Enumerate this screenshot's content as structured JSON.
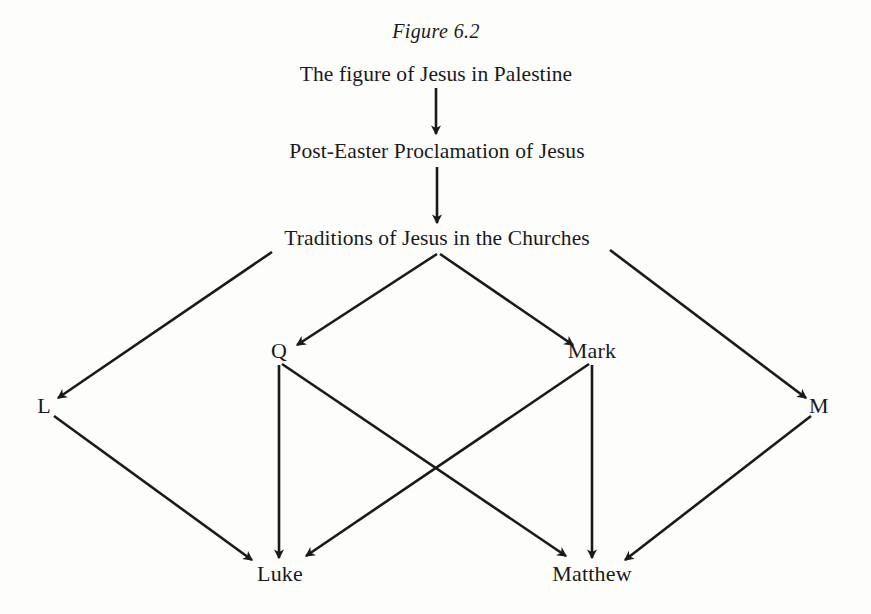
{
  "figure": {
    "title": "Figure 6.2",
    "background_color": "#fdfdfc",
    "ink_color": "#1a1a1a"
  },
  "nodes": [
    {
      "id": "palestine",
      "label": "The figure of Jesus in Palestine",
      "x": 436,
      "y": 75,
      "kind": "stage"
    },
    {
      "id": "proclaim",
      "label": "Post-Easter Proclamation of Jesus",
      "x": 437,
      "y": 152,
      "kind": "stage"
    },
    {
      "id": "traditions",
      "label": "Traditions of Jesus in the Churches",
      "x": 437,
      "y": 239,
      "kind": "stage"
    },
    {
      "id": "q",
      "label": "Q",
      "x": 279,
      "y": 351,
      "kind": "source"
    },
    {
      "id": "mark",
      "label": "Mark",
      "x": 592,
      "y": 351,
      "kind": "source"
    },
    {
      "id": "l",
      "label": "L",
      "x": 44,
      "y": 406,
      "kind": "source"
    },
    {
      "id": "m",
      "label": "M",
      "x": 819,
      "y": 406,
      "kind": "source"
    },
    {
      "id": "luke",
      "label": "Luke",
      "x": 280,
      "y": 574,
      "kind": "gospel"
    },
    {
      "id": "matthew",
      "label": "Matthew",
      "x": 592,
      "y": 574,
      "kind": "gospel"
    }
  ],
  "edges": [
    {
      "id": "palestine-to-proclaim",
      "from": "palestine",
      "to": "proclaim",
      "x1": 436,
      "y1": 88,
      "x2": 436,
      "y2": 134
    },
    {
      "id": "proclaim-to-traditions",
      "from": "proclaim",
      "to": "traditions",
      "x1": 437,
      "y1": 167,
      "x2": 437,
      "y2": 223
    },
    {
      "id": "traditions-to-q",
      "from": "traditions",
      "to": "q",
      "x1": 437,
      "y1": 254,
      "x2": 297,
      "y2": 345
    },
    {
      "id": "traditions-to-mark",
      "from": "traditions",
      "to": "mark",
      "x1": 440,
      "y1": 254,
      "x2": 573,
      "y2": 345
    },
    {
      "id": "traditions-to-l",
      "from": "traditions",
      "to": "l",
      "x1": 272,
      "y1": 252,
      "x2": 58,
      "y2": 398
    },
    {
      "id": "traditions-to-m",
      "from": "traditions",
      "to": "m",
      "x1": 610,
      "y1": 250,
      "x2": 806,
      "y2": 398
    },
    {
      "id": "q-to-luke",
      "from": "q",
      "to": "luke",
      "x1": 279,
      "y1": 365,
      "x2": 279,
      "y2": 558
    },
    {
      "id": "q-to-matthew",
      "from": "q",
      "to": "matthew",
      "x1": 282,
      "y1": 364,
      "x2": 566,
      "y2": 556
    },
    {
      "id": "mark-to-luke",
      "from": "mark",
      "to": "luke",
      "x1": 589,
      "y1": 364,
      "x2": 306,
      "y2": 556
    },
    {
      "id": "mark-to-matthew",
      "from": "mark",
      "to": "matthew",
      "x1": 592,
      "y1": 365,
      "x2": 592,
      "y2": 558
    },
    {
      "id": "l-to-luke",
      "from": "l",
      "to": "luke",
      "x1": 54,
      "y1": 416,
      "x2": 252,
      "y2": 560
    },
    {
      "id": "m-to-matthew",
      "from": "m",
      "to": "matthew",
      "x1": 811,
      "y1": 416,
      "x2": 625,
      "y2": 560
    }
  ],
  "chart_data": {
    "type": "diagram",
    "title": "Figure 6.2",
    "subtype": "synoptic-problem-two-source-flowchart",
    "direction": "top-to-bottom",
    "levels": [
      {
        "level": 1,
        "nodes": [
          "The figure of Jesus in Palestine"
        ]
      },
      {
        "level": 2,
        "nodes": [
          "Post-Easter Proclamation of Jesus"
        ]
      },
      {
        "level": 3,
        "nodes": [
          "Traditions of Jesus in the Churches"
        ]
      },
      {
        "level": 4,
        "nodes": [
          "Q",
          "Mark"
        ]
      },
      {
        "level": 4,
        "nodes": [
          "L",
          "M"
        ]
      },
      {
        "level": 5,
        "nodes": [
          "Luke",
          "Matthew"
        ]
      }
    ],
    "relations": [
      [
        "The figure of Jesus in Palestine",
        "Post-Easter Proclamation of Jesus"
      ],
      [
        "Post-Easter Proclamation of Jesus",
        "Traditions of Jesus in the Churches"
      ],
      [
        "Traditions of Jesus in the Churches",
        "Q"
      ],
      [
        "Traditions of Jesus in the Churches",
        "Mark"
      ],
      [
        "Traditions of Jesus in the Churches",
        "L"
      ],
      [
        "Traditions of Jesus in the Churches",
        "M"
      ],
      [
        "Q",
        "Luke"
      ],
      [
        "Q",
        "Matthew"
      ],
      [
        "Mark",
        "Luke"
      ],
      [
        "Mark",
        "Matthew"
      ],
      [
        "L",
        "Luke"
      ],
      [
        "M",
        "Matthew"
      ]
    ]
  }
}
